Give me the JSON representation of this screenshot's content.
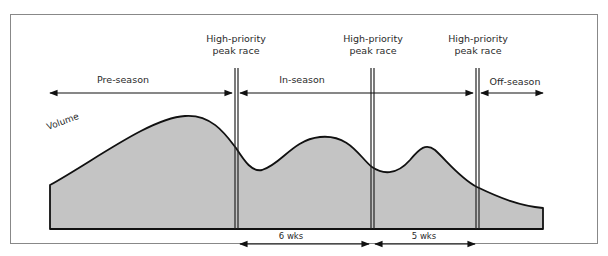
{
  "figure": {
    "curve_label": "Volume",
    "race_markers": [
      {
        "line1": "High-priority",
        "line2": "peak race",
        "x": 236
      },
      {
        "line1": "High-priority",
        "line2": "peak race",
        "x": 372
      },
      {
        "line1": "High-priority",
        "line2": "peak race",
        "x": 477
      }
    ],
    "phases": [
      {
        "label": "Pre-season",
        "x_start": 50,
        "x_end": 232
      },
      {
        "label": "In-season",
        "x_start": 240,
        "x_end": 473
      },
      {
        "label": "Off-season",
        "x_start": 481,
        "x_end": 543
      }
    ],
    "intervals": [
      {
        "label": "6 wks",
        "x_start": 240,
        "x_end": 369
      },
      {
        "label": "5 wks",
        "x_start": 375,
        "x_end": 475
      }
    ],
    "colors": {
      "fill": "#c4c4c4",
      "stroke": "#111111",
      "frame": "#888888"
    }
  }
}
